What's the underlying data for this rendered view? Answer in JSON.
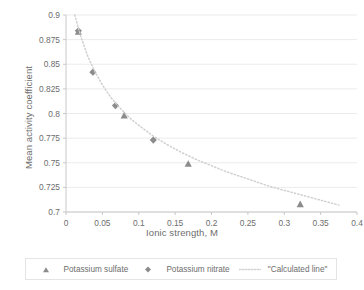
{
  "chart_data": {
    "type": "scatter",
    "title": "",
    "xlabel": "Ionic strength, M",
    "ylabel": "Mean activity coefficient",
    "xlim": [
      0,
      0.4
    ],
    "ylim": [
      0.7,
      0.9
    ],
    "xticks": [
      "0",
      "0.05",
      "0.1",
      "0.15",
      "0.2",
      "0.25",
      "0.3",
      "0.35",
      "0.4"
    ],
    "xtick_values": [
      0,
      0.05,
      0.1,
      0.15,
      0.2,
      0.25,
      0.3,
      0.35,
      0.4
    ],
    "yticks": [
      "0.7",
      "0.725",
      "0.75",
      "0.775",
      "0.8",
      "0.825",
      "0.85",
      "0.875",
      "0.9"
    ],
    "ytick_values": [
      0.7,
      0.725,
      0.75,
      0.775,
      0.8,
      0.825,
      0.85,
      0.875,
      0.9
    ],
    "grid": "horizontal",
    "legend_position": "bottom",
    "series": [
      {
        "name": "Potassium sulfate",
        "marker": "triangle",
        "color": "#8c8c8c",
        "points": [
          {
            "x": 0.017,
            "y": 0.883
          },
          {
            "x": 0.08,
            "y": 0.798
          },
          {
            "x": 0.168,
            "y": 0.749
          },
          {
            "x": 0.322,
            "y": 0.708
          }
        ]
      },
      {
        "name": "Potassium nitrate",
        "marker": "diamond",
        "color": "#8c8c8c",
        "points": [
          {
            "x": 0.017,
            "y": 0.884
          },
          {
            "x": 0.037,
            "y": 0.842
          },
          {
            "x": 0.068,
            "y": 0.808
          },
          {
            "x": 0.12,
            "y": 0.773
          }
        ]
      },
      {
        "name": "\"Calculated line\"",
        "marker": "dotted-line",
        "color": "#d0d0d0",
        "points": [
          {
            "x": 0.012,
            "y": 0.9
          },
          {
            "x": 0.02,
            "y": 0.879
          },
          {
            "x": 0.03,
            "y": 0.858
          },
          {
            "x": 0.04,
            "y": 0.842
          },
          {
            "x": 0.05,
            "y": 0.829
          },
          {
            "x": 0.06,
            "y": 0.818
          },
          {
            "x": 0.07,
            "y": 0.809
          },
          {
            "x": 0.08,
            "y": 0.801
          },
          {
            "x": 0.09,
            "y": 0.794
          },
          {
            "x": 0.1,
            "y": 0.788
          },
          {
            "x": 0.12,
            "y": 0.777
          },
          {
            "x": 0.14,
            "y": 0.768
          },
          {
            "x": 0.16,
            "y": 0.76
          },
          {
            "x": 0.18,
            "y": 0.753
          },
          {
            "x": 0.2,
            "y": 0.747
          },
          {
            "x": 0.22,
            "y": 0.741
          },
          {
            "x": 0.24,
            "y": 0.736
          },
          {
            "x": 0.26,
            "y": 0.731
          },
          {
            "x": 0.28,
            "y": 0.726
          },
          {
            "x": 0.3,
            "y": 0.722
          },
          {
            "x": 0.32,
            "y": 0.718
          },
          {
            "x": 0.34,
            "y": 0.714
          },
          {
            "x": 0.36,
            "y": 0.71
          },
          {
            "x": 0.375,
            "y": 0.707
          }
        ]
      }
    ]
  },
  "axes": {
    "x_title": "Ionic strength, M",
    "y_title": "Mean activity coefficient"
  },
  "legend": {
    "items": [
      {
        "label": "Potassium sulfate",
        "marker": "triangle"
      },
      {
        "label": "Potassium nitrate",
        "marker": "diamond"
      },
      {
        "label": "\"Calculated line\"",
        "marker": "dotted-line"
      }
    ]
  },
  "colors": {
    "marker": "#8c8c8c",
    "gridline": "#ebebeb",
    "axis": "#c8c8c8",
    "text": "#6d6d6d",
    "calculated_line": "#d2d2d2",
    "legend_border": "#e4e4e4"
  }
}
